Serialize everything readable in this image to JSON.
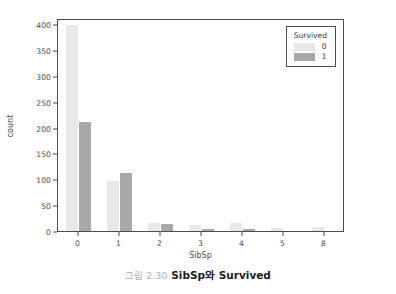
{
  "chart_data": {
    "type": "bar",
    "title": "",
    "xlabel": "SibSp",
    "ylabel": "count",
    "categories": [
      "0",
      "1",
      "2",
      "3",
      "4",
      "5",
      "8"
    ],
    "series": [
      {
        "name": "0",
        "color": "#e8e8e8",
        "values": [
          398,
          97,
          15,
          12,
          15,
          5,
          7
        ]
      },
      {
        "name": "1",
        "color": "#a8a8a8",
        "values": [
          210,
          112,
          13,
          4,
          3,
          0,
          0
        ]
      }
    ],
    "legend": {
      "title": "Survived",
      "position": "top-right",
      "entries": [
        "0",
        "1"
      ]
    },
    "yticks": [
      0,
      50,
      100,
      150,
      200,
      250,
      300,
      350,
      400
    ],
    "ylim": [
      0,
      412
    ],
    "xticklabels": [
      "0",
      "1",
      "2",
      "3",
      "4",
      "5",
      "8"
    ],
    "grid": false
  },
  "axes": {
    "y_label": "count",
    "x_label": "SibSp",
    "y_ticks": [
      "0",
      "50",
      "100",
      "150",
      "200",
      "250",
      "300",
      "350",
      "400"
    ],
    "x_ticks": [
      "0",
      "1",
      "2",
      "3",
      "4",
      "5",
      "8"
    ]
  },
  "legend": {
    "title": "Survived",
    "items": [
      {
        "label": "0",
        "color": "#e8e8e8"
      },
      {
        "label": "1",
        "color": "#a8a8a8"
      }
    ]
  },
  "caption": {
    "number": "그림 2.30",
    "text": "SibSp와 Survived"
  }
}
